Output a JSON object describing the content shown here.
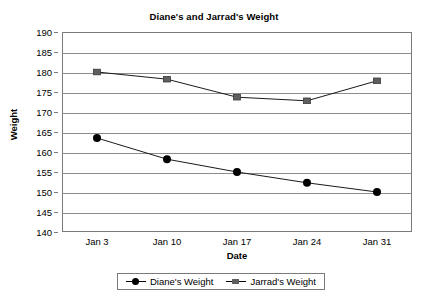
{
  "chart_data": {
    "type": "line",
    "title": "Diane's and Jarrad's Weight",
    "xlabel": "Date",
    "ylabel": "Weight",
    "categories": [
      "Jan 3",
      "Jan 10",
      "Jan 17",
      "Jan 24",
      "Jan 31"
    ],
    "ylim": [
      140,
      190
    ],
    "yticks": [
      190,
      185,
      180,
      175,
      170,
      165,
      160,
      155,
      150,
      145,
      140
    ],
    "grid": true,
    "legend_position": "bottom",
    "series": [
      {
        "name": "Diane's Weight",
        "marker": "circle",
        "color": "#000000",
        "values": [
          163.5,
          158.2,
          155.0,
          152.3,
          150.0
        ]
      },
      {
        "name": "Jarrad's Weight",
        "marker": "square",
        "color": "#5f5f5f",
        "values": [
          180.0,
          178.2,
          173.7,
          172.8,
          177.8
        ]
      }
    ]
  }
}
